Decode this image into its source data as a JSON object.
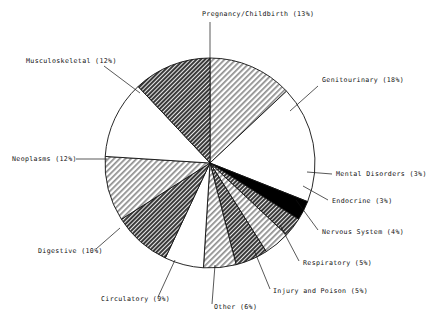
{
  "chart_data": {
    "type": "pie",
    "title": "",
    "subtitle": "",
    "xlabel": "",
    "ylabel": "",
    "legend_position": "external-labels-with-leader-lines",
    "grid": false,
    "start_angle_deg": 90,
    "direction": "clockwise",
    "units": "percent",
    "categories": [
      "Pregnancy/Childbirth",
      "Genitourinary",
      "Mental Disorders",
      "Endocrine",
      "Nervous System",
      "Respiratory",
      "Injury and Poison",
      "Other",
      "Circulatory",
      "Digestive",
      "Neoplasms",
      "Musculoskeletal"
    ],
    "values": [
      13,
      18,
      3,
      3,
      4,
      5,
      5,
      6,
      9,
      10,
      12,
      12
    ],
    "labels": [
      "Pregnancy/Childbirth (13%)",
      "Genitourinary (18%)",
      "Mental Disorders (3%)",
      "Endocrine (3%)",
      "Nervous System (4%)",
      "Respiratory (5%)",
      "Injury and Poison (5%)",
      "Other (6%)",
      "Circulatory (9%)",
      "Digestive (10%)",
      "Neoplasms (12%)",
      "Musculoskeletal (12%)"
    ],
    "slice_fills": [
      "light-diagonal-hatch",
      "white",
      "solid-black",
      "dark-diagonal-hatch",
      "light-diagonal-hatch",
      "dark-diagonal-hatch",
      "light-diagonal-hatch",
      "white",
      "dark-diagonal-hatch",
      "light-diagonal-hatch",
      "white",
      "dark-diagonal-hatch"
    ]
  },
  "slices": [
    {
      "label": "Pregnancy/Childbirth (13%)",
      "value": 13,
      "fill": "light-diagonal-hatch",
      "label_x": 202,
      "label_y": 16,
      "anchor": "start",
      "leader": {
        "x1": 210,
        "y1": 22,
        "x2": 210,
        "y2": 58
      }
    },
    {
      "label": "Genitourinary (18%)",
      "value": 18,
      "fill": "white",
      "label_x": 322,
      "label_y": 82,
      "anchor": "start",
      "leader": {
        "x1": 318,
        "y1": 86,
        "x2": 290,
        "y2": 111
      }
    },
    {
      "label": "Mental Disorders (3%)",
      "value": 3,
      "fill": "solid-black",
      "label_x": 336,
      "label_y": 176,
      "anchor": "start",
      "leader": {
        "x1": 332,
        "y1": 174,
        "x2": 307,
        "y2": 172
      }
    },
    {
      "label": "Endocrine (3%)",
      "value": 3,
      "fill": "dark-diagonal-hatch",
      "label_x": 332,
      "label_y": 203,
      "anchor": "start",
      "leader": {
        "x1": 328,
        "y1": 200,
        "x2": 303,
        "y2": 186
      }
    },
    {
      "label": "Nervous System (4%)",
      "value": 4,
      "fill": "light-diagonal-hatch",
      "label_x": 322,
      "label_y": 234,
      "anchor": "start",
      "leader": {
        "x1": 318,
        "y1": 230,
        "x2": 296,
        "y2": 200
      }
    },
    {
      "label": "Respiratory (5%)",
      "value": 5,
      "fill": "dark-diagonal-hatch",
      "label_x": 303,
      "label_y": 265,
      "anchor": "start",
      "leader": {
        "x1": 299,
        "y1": 261,
        "x2": 280,
        "y2": 225
      }
    },
    {
      "label": "Injury and Poison (5%)",
      "value": 5,
      "fill": "light-diagonal-hatch",
      "label_x": 273,
      "label_y": 293,
      "anchor": "start",
      "leader": {
        "x1": 270,
        "y1": 289,
        "x2": 254,
        "y2": 250
      }
    },
    {
      "label": "Other (6%)",
      "value": 6,
      "fill": "white",
      "label_x": 214,
      "label_y": 309,
      "anchor": "start",
      "leader": {
        "x1": 212,
        "y1": 304,
        "x2": 215,
        "y2": 265
      }
    },
    {
      "label": "Circulatory (9%)",
      "value": 9,
      "fill": "dark-diagonal-hatch",
      "label_x": 101,
      "label_y": 301,
      "anchor": "start",
      "leader": {
        "x1": 158,
        "y1": 297,
        "x2": 175,
        "y2": 260
      }
    },
    {
      "label": "Digestive (10%)",
      "value": 10,
      "fill": "light-diagonal-hatch",
      "label_x": 38,
      "label_y": 253,
      "anchor": "start",
      "leader": {
        "x1": 96,
        "y1": 249,
        "x2": 120,
        "y2": 228
      }
    },
    {
      "label": "Neoplasms (12%)",
      "value": 12,
      "fill": "white",
      "label_x": 12,
      "label_y": 161,
      "anchor": "start",
      "leader": {
        "x1": 76,
        "y1": 159,
        "x2": 107,
        "y2": 159
      }
    },
    {
      "label": "Musculoskeletal (12%)",
      "value": 12,
      "fill": "dark-diagonal-hatch",
      "label_x": 26,
      "label_y": 63,
      "anchor": "start",
      "leader": {
        "x1": 104,
        "y1": 66,
        "x2": 140,
        "y2": 93
      }
    }
  ],
  "geometry": {
    "center_x": 210,
    "center_y": 163,
    "radius": 105
  },
  "colors": {
    "outline": "#111111",
    "background": "#ffffff",
    "solid_black": "#000000",
    "hatch_dark": "#4a4a4a",
    "hatch_light": "#b4b4b4"
  }
}
